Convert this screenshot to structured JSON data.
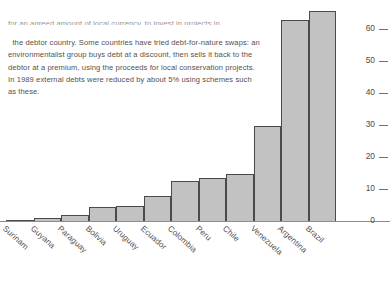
{
  "caption": {
    "cut_line": "for an agreed amount of local currency, to invest in projects in",
    "body": "the debtor country. Some countries have tried debt-for-nature swaps: an environmentalist group buys debt at a discount, then sells it back to the debtor at a premium, using the proceeds for local conservation projects. In 1989 external debts were reduced by about 5% using schemes such as these."
  },
  "chart_data": {
    "type": "bar",
    "title": "",
    "xlabel": "",
    "ylabel": "",
    "ylim": [
      0,
      66
    ],
    "grid": false,
    "legend": null,
    "categories": [
      "Surinam",
      "Guyana",
      "Paraguay",
      "Bolivia",
      "Uruguay",
      "Ecuador",
      "Colombia",
      "Peru",
      "Chile",
      "Venezuela",
      "Argentina",
      "Brazil"
    ],
    "values": [
      0.4,
      1.2,
      2.2,
      4.7,
      5.0,
      8.0,
      12.8,
      13.8,
      15.0,
      30.0,
      63.0,
      66.0
    ],
    "ytick_labels": [
      "0",
      "10",
      "20",
      "30",
      "40",
      "50",
      "60"
    ],
    "ytick_values": [
      0,
      10,
      20,
      30,
      40,
      50,
      60
    ],
    "bar_color": "#c2c2c2",
    "bar_edge_color": "#4a4a4a",
    "axis_color": "#8d8d8d",
    "note": "Argentina and Brazil bars are clipped by the top edge of the image"
  }
}
